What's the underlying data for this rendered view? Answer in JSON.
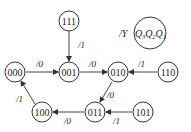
{
  "diagram": {
    "type": "state-transition-diagram",
    "legend": {
      "output_label": "/Y",
      "state_label": "Q3Q2Q1",
      "state_label_display": [
        "Q",
        "3",
        "Q",
        "2",
        "Q",
        "1"
      ]
    },
    "nodes": [
      {
        "id": "111",
        "label": "111",
        "x": 69,
        "y": 21
      },
      {
        "id": "000",
        "label": "000",
        "x": 15,
        "y": 72
      },
      {
        "id": "001",
        "label": "001",
        "x": 69,
        "y": 72
      },
      {
        "id": "010",
        "label": "010",
        "x": 118,
        "y": 72
      },
      {
        "id": "110",
        "label": "110",
        "x": 168,
        "y": 72
      },
      {
        "id": "100",
        "label": "100",
        "x": 42,
        "y": 112
      },
      {
        "id": "011",
        "label": "011",
        "x": 95,
        "y": 112
      },
      {
        "id": "101",
        "label": "101",
        "x": 143,
        "y": 112
      }
    ],
    "edges": [
      {
        "from": "111",
        "to": "001",
        "label": "/1"
      },
      {
        "from": "000",
        "to": "001",
        "label": "/0"
      },
      {
        "from": "001",
        "to": "010",
        "label": "/0"
      },
      {
        "from": "110",
        "to": "010",
        "label": "/1"
      },
      {
        "from": "010",
        "to": "011",
        "label": "/0"
      },
      {
        "from": "101",
        "to": "011",
        "label": "/1"
      },
      {
        "from": "011",
        "to": "100",
        "label": "/0"
      },
      {
        "from": "100",
        "to": "000",
        "label": "/1"
      }
    ]
  }
}
